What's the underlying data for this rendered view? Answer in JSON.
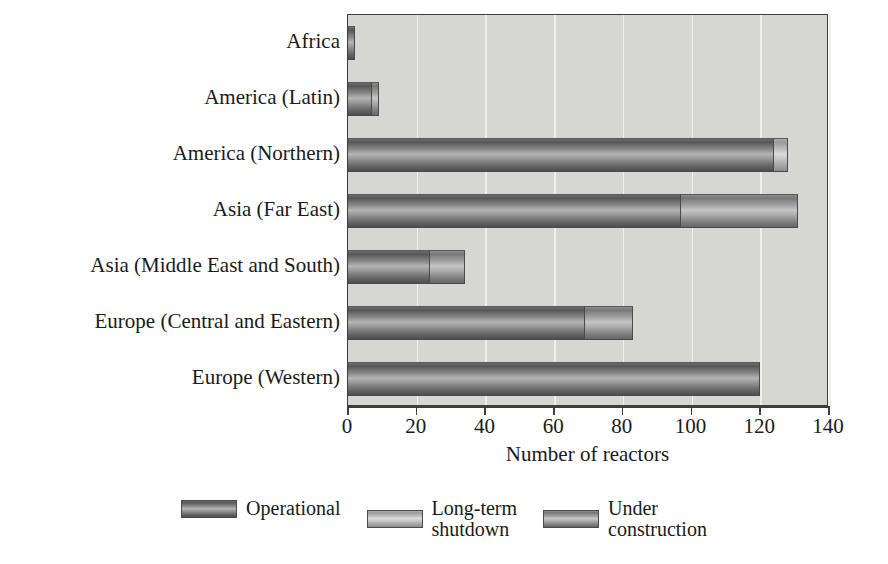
{
  "chart_data": {
    "type": "bar",
    "orientation": "horizontal",
    "stacked": true,
    "title": "",
    "xlabel": "Number of reactors",
    "ylabel": "",
    "xlim": [
      0,
      140
    ],
    "xticks": [
      0,
      20,
      40,
      60,
      80,
      100,
      120,
      140
    ],
    "xtick_labels": [
      "0",
      "20",
      "40",
      "60",
      "80",
      "100",
      "120",
      "140"
    ],
    "grid": true,
    "grid_axis": "x",
    "legend_position": "bottom",
    "categories": [
      "Africa",
      "America (Latin)",
      "America (Northern)",
      "Asia (Far East)",
      "Asia (Middle East and South)",
      "Europe (Central and Eastern)",
      "Europe (Western)"
    ],
    "series": [
      {
        "name": "Operational",
        "color": "#6a6a6a",
        "values": [
          2,
          7,
          124,
          97,
          24,
          69,
          120
        ]
      },
      {
        "name": "Long-term shutdown",
        "color": "#c0c0c0",
        "values": [
          0,
          0,
          4,
          0,
          0,
          0,
          0
        ]
      },
      {
        "name": "Under construction",
        "color": "#909090",
        "values": [
          0,
          2,
          0,
          34,
          10,
          14,
          0
        ]
      }
    ],
    "totals": [
      2,
      9,
      128,
      131,
      34,
      83,
      120
    ]
  },
  "legend": {
    "entries": [
      {
        "label": "Operational",
        "swatch": "operational"
      },
      {
        "label": "Long-term\nshutdown",
        "swatch": "longterm"
      },
      {
        "label": "Under\nconstruction",
        "swatch": "under"
      }
    ]
  },
  "axis": {
    "x_title": "Number of reactors"
  },
  "colors": {
    "plot_background": "#d6d6d2",
    "frame": "#3d3d3d",
    "gridline": "#efefec",
    "page_background": "#ffffff",
    "text": "#1a1a1a"
  }
}
